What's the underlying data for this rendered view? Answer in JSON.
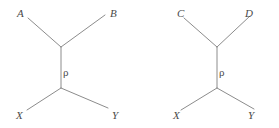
{
  "figure": {
    "background_color": "#ffffff",
    "line_color": "#8c8c8c",
    "label_color": "#4a4a4a",
    "width": 279,
    "height": 128
  },
  "diagrams": [
    {
      "id": "left-diagram",
      "upper_left_label": "A",
      "upper_right_label": "B",
      "propagator_label": "ρ",
      "lower_left_label": "X",
      "lower_right_label": "Y"
    },
    {
      "id": "right-diagram",
      "upper_left_label": "C",
      "upper_right_label": "D",
      "propagator_label": "ρ",
      "lower_left_label": "X",
      "lower_right_label": "Y"
    }
  ]
}
